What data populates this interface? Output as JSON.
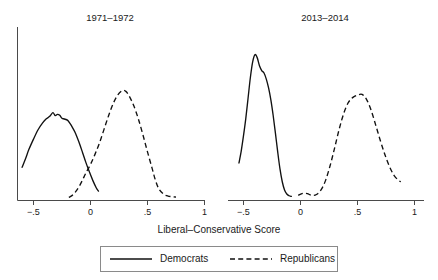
{
  "figure": {
    "axis_title": "Liberal–Conservative Score",
    "background_color": "#ffffff",
    "line_color": "#111111",
    "axis_color": "#4a4a4a"
  },
  "legend": {
    "position": "bottom-center",
    "entries": [
      {
        "label": "Democrats",
        "style": "solid"
      },
      {
        "label": "Republicans",
        "style": "dashed"
      }
    ]
  },
  "panels": [
    {
      "title": "1971–1972",
      "tick_labels": [
        "−.5",
        "0",
        ".5",
        "1"
      ]
    },
    {
      "title": "2013–2014",
      "tick_labels": [
        "−.5",
        "0",
        ".5",
        "1"
      ]
    }
  ],
  "chart_data": {
    "type": "line",
    "title": "",
    "xlabel": "Liberal–Conservative Score",
    "ylabel": "",
    "xlim": [
      -0.75,
      1.1
    ],
    "ylim": [
      0,
      1.0
    ],
    "grid": false,
    "legend_position": "bottom-center",
    "ticks": [
      -0.5,
      0,
      0.5,
      1
    ],
    "tick_labels": [
      "−.5",
      "0",
      ".5",
      "1"
    ],
    "panels": [
      {
        "title": "1971–1972",
        "series": [
          {
            "name": "Democrats",
            "style": "solid",
            "x": [
              -0.6,
              -0.57,
              -0.54,
              -0.5,
              -0.46,
              -0.42,
              -0.39,
              -0.36,
              -0.33,
              -0.31,
              -0.29,
              -0.27,
              -0.25,
              -0.23,
              -0.2,
              -0.18,
              -0.16,
              -0.13,
              -0.1,
              -0.07,
              -0.04,
              -0.01,
              0.02,
              0.05,
              0.07
            ],
            "y": [
              0.195,
              0.245,
              0.3,
              0.36,
              0.415,
              0.455,
              0.478,
              0.492,
              0.515,
              0.498,
              0.505,
              0.5,
              0.482,
              0.478,
              0.47,
              0.452,
              0.43,
              0.392,
              0.34,
              0.282,
              0.222,
              0.168,
              0.118,
              0.075,
              0.055
            ]
          },
          {
            "name": "Republicans",
            "style": "dashed",
            "x": [
              -0.19,
              -0.16,
              -0.13,
              -0.1,
              -0.07,
              -0.04,
              0.0,
              0.04,
              0.08,
              0.12,
              0.16,
              0.2,
              0.24,
              0.28,
              0.31,
              0.34,
              0.38,
              0.42,
              0.46,
              0.5,
              0.54,
              0.57,
              0.6,
              0.64,
              0.68,
              0.72,
              0.75
            ],
            "y": [
              0.018,
              0.03,
              0.052,
              0.082,
              0.12,
              0.162,
              0.212,
              0.272,
              0.34,
              0.42,
              0.5,
              0.57,
              0.62,
              0.645,
              0.64,
              0.612,
              0.555,
              0.478,
              0.385,
              0.285,
              0.19,
              0.118,
              0.068,
              0.038,
              0.026,
              0.022,
              0.02
            ]
          }
        ]
      },
      {
        "title": "2013–2014",
        "series": [
          {
            "name": "Democrats",
            "style": "solid",
            "x": [
              -0.54,
              -0.52,
              -0.5,
              -0.48,
              -0.46,
              -0.44,
              -0.42,
              -0.4,
              -0.38,
              -0.36,
              -0.34,
              -0.32,
              -0.3,
              -0.28,
              -0.26,
              -0.24,
              -0.22,
              -0.2,
              -0.18,
              -0.16,
              -0.14,
              -0.12,
              -0.1,
              -0.08
            ],
            "y": [
              0.22,
              0.29,
              0.38,
              0.48,
              0.6,
              0.72,
              0.812,
              0.855,
              0.838,
              0.79,
              0.762,
              0.748,
              0.712,
              0.66,
              0.59,
              0.5,
              0.395,
              0.285,
              0.185,
              0.11,
              0.062,
              0.038,
              0.028,
              0.024
            ]
          },
          {
            "name": "Republicans",
            "style": "dashed",
            "x": [
              -0.02,
              0.02,
              0.06,
              0.1,
              0.14,
              0.18,
              0.22,
              0.26,
              0.3,
              0.34,
              0.38,
              0.42,
              0.46,
              0.5,
              0.54,
              0.58,
              0.62,
              0.66,
              0.7,
              0.74,
              0.78,
              0.82,
              0.86,
              0.88
            ],
            "y": [
              0.03,
              0.042,
              0.04,
              0.03,
              0.035,
              0.062,
              0.118,
              0.205,
              0.31,
              0.42,
              0.512,
              0.575,
              0.605,
              0.618,
              0.622,
              0.592,
              0.528,
              0.442,
              0.352,
              0.27,
              0.2,
              0.148,
              0.118,
              0.11
            ]
          }
        ]
      }
    ]
  }
}
